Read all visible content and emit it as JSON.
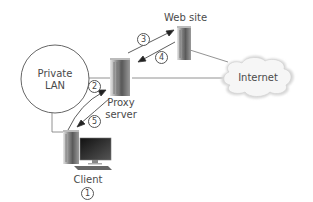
{
  "diagram": {
    "nodes": {
      "private_lan": {
        "label_line1": "Private",
        "label_line2": "LAN"
      },
      "proxy": {
        "label_line1": "Proxy",
        "label_line2": "server"
      },
      "website": {
        "label": "Web site"
      },
      "internet": {
        "label": "Internet"
      },
      "client": {
        "label": "Client"
      }
    },
    "steps": {
      "s1": "1",
      "s2": "2",
      "s3": "3",
      "s4": "4",
      "s5": "5"
    }
  }
}
